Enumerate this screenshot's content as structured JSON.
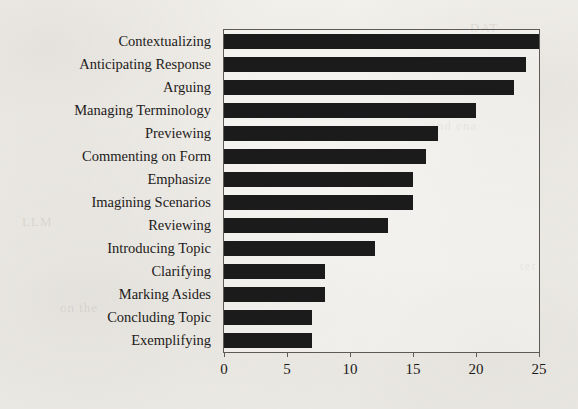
{
  "chart_data": {
    "type": "bar",
    "orientation": "horizontal",
    "title": "",
    "subtitle": "",
    "xlabel": "",
    "ylabel": "",
    "categories": [
      "Contextualizing",
      "Anticipating Response",
      "Arguing",
      "Managing Terminology",
      "Previewing",
      "Commenting on Form",
      "Emphasize",
      "Imagining Scenarios",
      "Reviewing",
      "Introducing Topic",
      "Clarifying",
      "Marking Asides",
      "Concluding Topic",
      "Exemplifying"
    ],
    "values": [
      25,
      24,
      23,
      20,
      17,
      16,
      15,
      15,
      13,
      12,
      8,
      8,
      7,
      7
    ],
    "xlim": [
      0,
      25
    ],
    "xticks": [
      0,
      5,
      10,
      15,
      20,
      25
    ],
    "xtick_labels": [
      "0",
      "5",
      "10",
      "15",
      "20",
      "25"
    ],
    "grid": false,
    "legend": null,
    "legend_position": "none",
    "bar_color": "#1b1b1b",
    "frame_color": "#5d5a55",
    "background_color": "#f4f2ee",
    "annotations": []
  },
  "ghost_text": [
    {
      "text": "and ena",
      "x": 430,
      "y": 118
    },
    {
      "text": "LLM",
      "x": 22,
      "y": 214
    },
    {
      "text": "DAT",
      "x": 470,
      "y": 20
    },
    {
      "text": "on the",
      "x": 60,
      "y": 300
    },
    {
      "text": "ter",
      "x": 520,
      "y": 258
    }
  ]
}
